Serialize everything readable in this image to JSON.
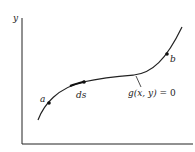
{
  "diagram": {
    "axis_y_label": "y",
    "point_a_label": "a",
    "point_ds_label": "ds",
    "point_b_label": "b",
    "curve_label_fn": "g(x, y)",
    "curve_label_eq": " = 0",
    "colors": {
      "line": "#222222",
      "background": "#ffffff"
    }
  }
}
